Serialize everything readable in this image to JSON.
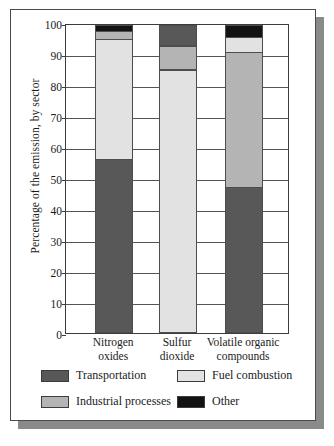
{
  "chart_data": {
    "type": "bar",
    "stacked": true,
    "title": "",
    "xlabel": "",
    "ylabel": "Percentage of the emission, by sector",
    "ylim": [
      0,
      100
    ],
    "yticks": [
      0,
      10,
      20,
      30,
      40,
      50,
      60,
      70,
      80,
      90,
      100
    ],
    "grid": true,
    "legend_position": "bottom",
    "categories": [
      "Nitrogen oxides",
      "Sulfur dioxide",
      "Volatile organic compounds"
    ],
    "category_lines": [
      [
        "Nitrogen",
        "oxides"
      ],
      [
        "Sulfur",
        "dioxide"
      ],
      [
        "Volatile organic",
        "compounds"
      ]
    ],
    "series": [
      {
        "name": "Transportation",
        "color": "#585858",
        "values": [
          56,
          7,
          47
        ]
      },
      {
        "name": "Fuel combustion",
        "color": "#e2e2e2",
        "values": [
          39,
          85,
          5
        ]
      },
      {
        "name": "Industrial processes",
        "color": "#b4b4b4",
        "values": [
          3,
          8,
          44
        ]
      },
      {
        "name": "Other",
        "color": "#131313",
        "values": [
          2,
          0,
          4
        ]
      }
    ],
    "stack_order": [
      [
        "Transportation",
        "Fuel combustion",
        "Industrial processes",
        "Other"
      ],
      [
        "Fuel combustion",
        "Industrial processes",
        "Transportation",
        "Other"
      ],
      [
        "Transportation",
        "Industrial processes",
        "Fuel combustion",
        "Other"
      ]
    ],
    "legend_entries": [
      {
        "label": "Transportation",
        "color": "#585858"
      },
      {
        "label": "Fuel combustion",
        "color": "#e2e2e2"
      },
      {
        "label": "Industrial processes",
        "color": "#b4b4b4"
      },
      {
        "label": "Other",
        "color": "#131313"
      }
    ]
  }
}
